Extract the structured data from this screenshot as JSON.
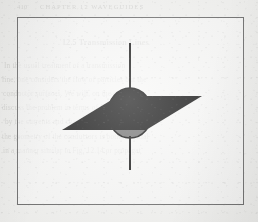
{
  "page": {
    "type": "scanned-book-page",
    "paper_color": "#f3f3f1",
    "running_head": "CHAPTER 12  WAVEGUIDES",
    "page_number": "410",
    "bleed_through_lines": [
      "12.5   Transmission Lines",
      "In the usual treatment of a transmission",
      "line, one considers the flow of particles but the",
      "conductor surfaces. We will, on the contrary,",
      "discuss the problem in terms of the fields set up",
      "by the currents and charges, and we shall see that",
      "the geometry of the conductors is both essential",
      "in a manner similar to Fig. 12.14 or propagat"
    ],
    "note": "background text is faint mirrored bleed-through from the reverse side of the sheet"
  },
  "frame": {
    "name": "figure-border",
    "x": 17,
    "y": 17,
    "width": 227,
    "height": 188,
    "stroke": "#6f6f6f",
    "stroke_width": 1
  },
  "figure": {
    "elements": {
      "plane": {
        "name": "intersecting-plane",
        "shape": "parallelogram",
        "fill": "#1c1c1c",
        "points": "62,130 118,96 202,96 146,130",
        "note": "plane drawn in perspective, extends past sphere on left and right"
      },
      "sphere": {
        "name": "sphere",
        "center_x": 130,
        "center_y": 113,
        "radius_x": 22,
        "radius_y": 25,
        "upper_hemisphere_fill": "#1c1c1c",
        "lower_hemisphere_fill": "#787878",
        "outline": "#141414",
        "outline_width": 1.4
      },
      "axis": {
        "name": "polar-axis",
        "x": 130,
        "y_top": 43,
        "y_bottom": 170,
        "stroke": "#1c1c1c",
        "stroke_width": 2
      },
      "equator": {
        "name": "equator-ellipse",
        "stroke": "#2a2a2a",
        "note": "the sphere/plane intersection circle, mostly hidden by the opaque plane"
      }
    },
    "colors": {
      "ink_dark": "#1c1c1c",
      "shade_grey": "#787878",
      "frame_grey": "#6f6f6f",
      "paper": "#f3f3f1"
    }
  }
}
